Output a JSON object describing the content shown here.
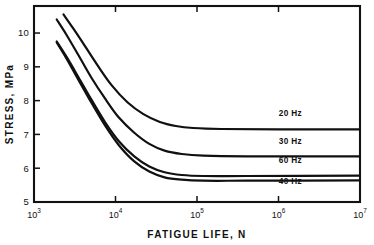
{
  "chart_data": {
    "type": "line",
    "title": "",
    "xlabel": "FATIGUE LIFE, N",
    "ylabel": "STRESS, MPa",
    "xscale": "log",
    "yscale": "linear",
    "xlim": [
      1000,
      10000000
    ],
    "ylim": [
      5,
      10.8
    ],
    "grid": false,
    "legend_position": "inline-right",
    "xticks": [
      {
        "value": 1000,
        "mantissa": "10",
        "exponent": "3"
      },
      {
        "value": 10000,
        "mantissa": "10",
        "exponent": "4"
      },
      {
        "value": 100000,
        "mantissa": "10",
        "exponent": "5"
      },
      {
        "value": 1000000,
        "mantissa": "10",
        "exponent": "6"
      },
      {
        "value": 10000000,
        "mantissa": "10",
        "exponent": "7"
      }
    ],
    "yticks": [
      {
        "value": 5,
        "label": "5"
      },
      {
        "value": 6,
        "label": "6"
      },
      {
        "value": 7,
        "label": "7"
      },
      {
        "value": 8,
        "label": "8"
      },
      {
        "value": 9,
        "label": "9"
      },
      {
        "value": 10,
        "label": "10"
      }
    ],
    "series": [
      {
        "name": "20 Hz",
        "label": "20 Hz",
        "color": "#101010",
        "label_x": 1400000,
        "label_y": 7.55,
        "points": [
          {
            "x": 2300,
            "y": 10.55
          },
          {
            "x": 3000,
            "y": 10.15
          },
          {
            "x": 4000,
            "y": 9.7
          },
          {
            "x": 6000,
            "y": 9.05
          },
          {
            "x": 9000,
            "y": 8.45
          },
          {
            "x": 14000,
            "y": 7.95
          },
          {
            "x": 22000,
            "y": 7.6
          },
          {
            "x": 35000,
            "y": 7.37
          },
          {
            "x": 55000,
            "y": 7.25
          },
          {
            "x": 90000,
            "y": 7.19
          },
          {
            "x": 200000,
            "y": 7.16
          },
          {
            "x": 1000000,
            "y": 7.15
          },
          {
            "x": 10000000,
            "y": 7.15
          }
        ]
      },
      {
        "name": "30 Hz",
        "label": "30 Hz",
        "color": "#101010",
        "label_x": 1400000,
        "label_y": 6.72,
        "points": [
          {
            "x": 1900,
            "y": 10.4
          },
          {
            "x": 2500,
            "y": 9.95
          },
          {
            "x": 3500,
            "y": 9.35
          },
          {
            "x": 5000,
            "y": 8.7
          },
          {
            "x": 7500,
            "y": 8.05
          },
          {
            "x": 11000,
            "y": 7.5
          },
          {
            "x": 17000,
            "y": 7.05
          },
          {
            "x": 26000,
            "y": 6.72
          },
          {
            "x": 40000,
            "y": 6.52
          },
          {
            "x": 65000,
            "y": 6.42
          },
          {
            "x": 120000,
            "y": 6.37
          },
          {
            "x": 400000,
            "y": 6.35
          },
          {
            "x": 10000000,
            "y": 6.35
          }
        ]
      },
      {
        "name": "60 Hz",
        "label": "60 Hz",
        "color": "#101010",
        "label_x": 1400000,
        "label_y": 6.15,
        "points": [
          {
            "x": 1900,
            "y": 9.75
          },
          {
            "x": 2500,
            "y": 9.3
          },
          {
            "x": 3500,
            "y": 8.7
          },
          {
            "x": 5000,
            "y": 8.05
          },
          {
            "x": 7500,
            "y": 7.35
          },
          {
            "x": 11000,
            "y": 6.8
          },
          {
            "x": 17000,
            "y": 6.35
          },
          {
            "x": 26000,
            "y": 6.05
          },
          {
            "x": 40000,
            "y": 5.88
          },
          {
            "x": 65000,
            "y": 5.8
          },
          {
            "x": 120000,
            "y": 5.77
          },
          {
            "x": 400000,
            "y": 5.77
          },
          {
            "x": 10000000,
            "y": 5.78
          }
        ]
      },
      {
        "name": "40 Hz",
        "label": "40 Hz",
        "color": "#101010",
        "label_x": 1400000,
        "label_y": 5.52,
        "points": [
          {
            "x": 1900,
            "y": 9.72
          },
          {
            "x": 2500,
            "y": 9.25
          },
          {
            "x": 3500,
            "y": 8.62
          },
          {
            "x": 5000,
            "y": 7.96
          },
          {
            "x": 7500,
            "y": 7.25
          },
          {
            "x": 11000,
            "y": 6.68
          },
          {
            "x": 17000,
            "y": 6.2
          },
          {
            "x": 26000,
            "y": 5.9
          },
          {
            "x": 40000,
            "y": 5.73
          },
          {
            "x": 65000,
            "y": 5.66
          },
          {
            "x": 120000,
            "y": 5.63
          },
          {
            "x": 400000,
            "y": 5.63
          },
          {
            "x": 10000000,
            "y": 5.64
          }
        ]
      }
    ]
  }
}
